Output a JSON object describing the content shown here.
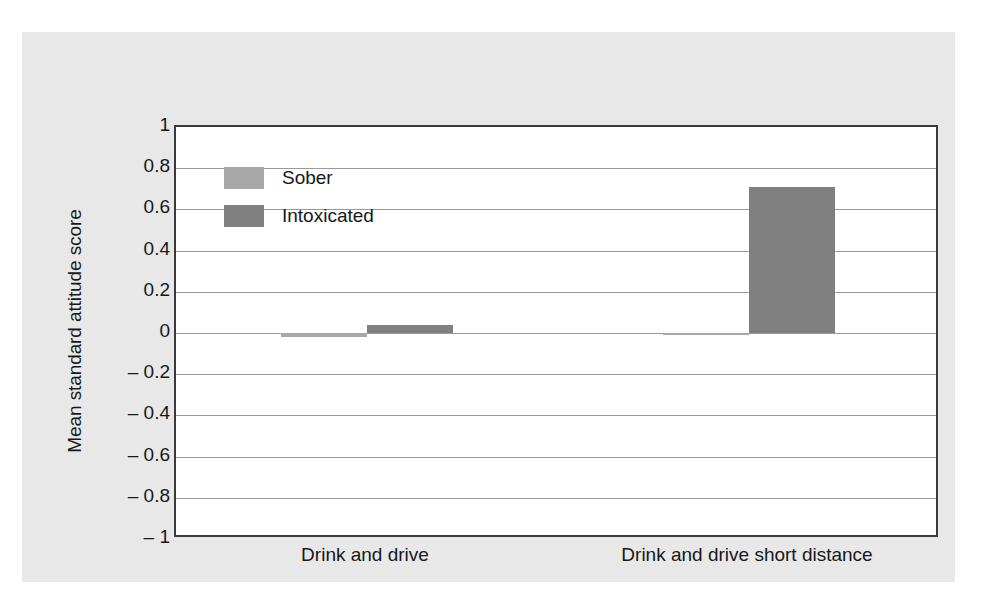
{
  "figure": {
    "background_color": "#e8e8e8",
    "plot_background_color": "#ffffff",
    "axis_color": "#3a3a3a",
    "gridline_color": "#9a9a9a"
  },
  "chart_data": {
    "type": "bar",
    "title": "",
    "xlabel": "",
    "ylabel": "Mean standard attitude score",
    "categories": [
      "Drink and drive",
      "Drink and drive short distance"
    ],
    "series": [
      {
        "name": "Sober",
        "color": "#a8a8a8",
        "values": [
          -0.02,
          -0.01
        ]
      },
      {
        "name": "Intoxicated",
        "color": "#808080",
        "values": [
          0.04,
          0.71
        ]
      }
    ],
    "ylim": [
      -1,
      1
    ],
    "yticks": [
      1,
      0.8,
      0.6,
      0.4,
      0.2,
      0,
      -0.2,
      -0.4,
      -0.6,
      -0.8,
      -1
    ],
    "ytick_labels": [
      "1",
      "0.8",
      "0.6",
      "0.4",
      "0.2",
      "0",
      "– 0.2",
      "– 0.4",
      "– 0.6",
      "– 0.8",
      "– 1"
    ],
    "grid": true,
    "grid_axis": "y",
    "legend_position": "upper left",
    "legend_entries": [
      "Sober",
      "Intoxicated"
    ]
  }
}
